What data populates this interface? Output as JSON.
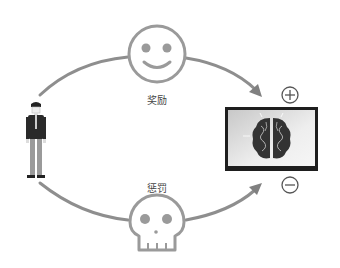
{
  "diagram": {
    "reward_label": "奖励",
    "punishment_label": "惩罚",
    "icons": {
      "person": "person-icon",
      "reward": "smiley-face-icon",
      "punishment": "skull-icon",
      "brain": "brain-icon",
      "positive": "plus-circle-icon",
      "negative": "minus-circle-icon"
    },
    "colors": {
      "stroke": "#9a9a9a",
      "arrow": "#888888",
      "dark": "#1e1e1e",
      "brain": "#333333",
      "box_bg": "#e6e6e6"
    }
  }
}
